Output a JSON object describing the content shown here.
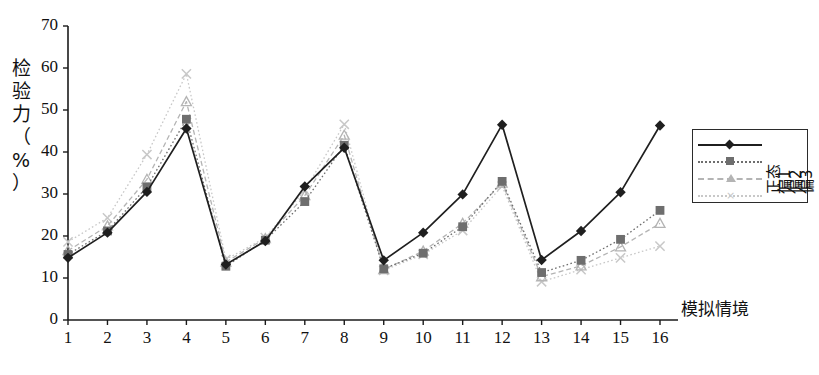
{
  "chart_data": {
    "type": "line",
    "title": "",
    "xlabel": "模拟情境",
    "ylabel": "检验力（%）",
    "ylabel_chars": [
      "检",
      "验",
      "力",
      "（",
      "%",
      "）"
    ],
    "xlim": [
      1,
      16
    ],
    "ylim": [
      0,
      70
    ],
    "yticks": [
      0,
      10,
      20,
      30,
      40,
      50,
      60,
      70
    ],
    "xticks": [
      1,
      2,
      3,
      4,
      5,
      6,
      7,
      8,
      9,
      10,
      11,
      12,
      13,
      14,
      15,
      16
    ],
    "grid": false,
    "legend_position": "right",
    "categories": [
      1,
      2,
      3,
      4,
      5,
      6,
      7,
      8,
      9,
      10,
      11,
      12,
      13,
      14,
      15,
      16
    ],
    "series": [
      {
        "name": "正态",
        "marker": "diamond",
        "color": "#1f1f1f",
        "line_style": "solid",
        "values": [
          14.8,
          20.8,
          30.5,
          45.6,
          13.2,
          18.8,
          31.8,
          41.0,
          14.2,
          20.8,
          29.9,
          46.5,
          14.3,
          21.2,
          30.4,
          46.3
        ]
      },
      {
        "name": "偏1",
        "marker": "square",
        "color": "#6e6e6e",
        "line_style": "dotted",
        "values": [
          15.6,
          21.2,
          31.7,
          47.8,
          12.8,
          19.0,
          28.2,
          41.6,
          12.2,
          15.9,
          22.2,
          33.0,
          11.3,
          14.2,
          19.2,
          26.1
        ]
      },
      {
        "name": "偏2",
        "marker": "triangle",
        "color": "#b4b4b4",
        "line_style": "dashed",
        "values": [
          16.5,
          22.4,
          33.5,
          52.0,
          13.8,
          19.4,
          29.6,
          44.0,
          12.0,
          16.4,
          23.0,
          32.6,
          10.3,
          12.9,
          17.4,
          23.0
        ]
      },
      {
        "name": "偏3",
        "marker": "x",
        "color": "#c8c8c8",
        "line_style": "dotted",
        "values": [
          18.6,
          24.3,
          39.4,
          58.6,
          14.4,
          19.6,
          30.9,
          46.6,
          11.8,
          15.6,
          21.3,
          31.9,
          9.1,
          12.0,
          14.8,
          17.6
        ]
      }
    ]
  },
  "legend": {
    "entries": [
      {
        "label": "正态",
        "marker": "diamond-marker",
        "color": "#1f1f1f"
      },
      {
        "label": "偏1",
        "marker": "square-marker",
        "color": "#6e6e6e"
      },
      {
        "label": "偏2",
        "marker": "triangle-marker",
        "color": "#b4b4b4"
      },
      {
        "label": "偏3",
        "marker": "x-marker",
        "color": "#c8c8c8"
      }
    ]
  },
  "axes": {
    "x_title": "模拟情境",
    "y_title": "检验力（%）"
  }
}
